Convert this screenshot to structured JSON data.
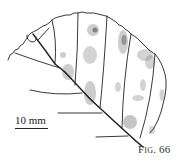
{
  "figure": {
    "caption": "Fig. 66",
    "scale_bar_label": "10 mm",
    "line_color": "#222222",
    "stipple_color": "#333333"
  }
}
